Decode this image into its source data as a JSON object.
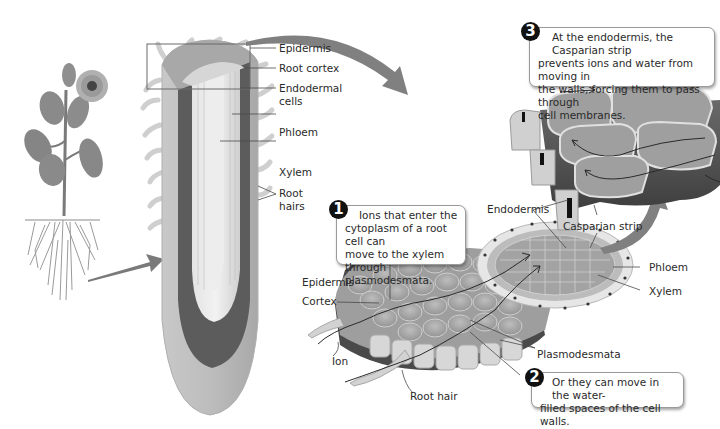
{
  "diagram": {
    "root_section_labels": {
      "epidermis": "Epidermis",
      "root_cortex": "Root cortex",
      "endodermal_cells": "Endodermal cells",
      "endodermal_cells_line1": "Endodermal",
      "endodermal_cells_line2": "cells",
      "phloem": "Phloem",
      "xylem": "Xylem",
      "root_hairs_line1": "Root",
      "root_hairs_line2": "hairs"
    },
    "cross_section_labels": {
      "epidermis": "Epidermis",
      "cortex": "Cortex",
      "ion": "Ion",
      "root_hair": "Root hair",
      "plasmodesmata": "Plasmodesmata",
      "endodermis": "Endodermis",
      "casparian_strip": "Casparian strip",
      "phloem": "Phloem",
      "xylem": "Xylem"
    },
    "callouts": [
      {
        "number": "1",
        "lines": [
          "Ions that enter the",
          "cytoplasm of a root cell can",
          "move to the xylem through",
          "plasmodesmata."
        ]
      },
      {
        "number": "2",
        "lines": [
          "Or they can move in the water-",
          "filled spaces of the cell walls."
        ]
      },
      {
        "number": "3",
        "lines": [
          "At the endodermis, the Casparian strip",
          "prevents ions and water from moving in",
          "the walls, forcing them to pass through",
          "cell membranes."
        ]
      }
    ],
    "colors": {
      "background": "#ffffff",
      "arrow": "#7d7d7d",
      "badge": "#111111",
      "text": "#2a2a2a",
      "cell_fill": "#a9a9a9",
      "dark_tissue": "#5a5a5a",
      "light_tissue": "#d4d4d4"
    }
  }
}
